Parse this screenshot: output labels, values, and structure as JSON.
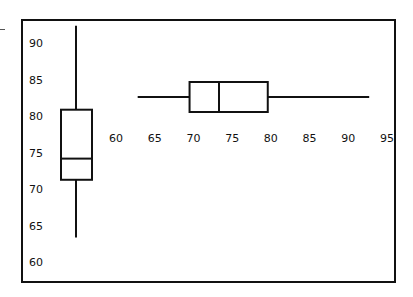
{
  "chart_data": [
    {
      "type": "boxplot",
      "orientation": "vertical",
      "title": "",
      "xlabel": "",
      "ylabel": "",
      "ticks": [
        "60",
        "65",
        "70",
        "75",
        "80",
        "85",
        "90"
      ],
      "ylim": [
        60,
        93
      ],
      "grid": false,
      "box": {
        "min": 63.5,
        "q1": 71.4,
        "median": 74.3,
        "q3": 81.0,
        "max": 92.5
      }
    },
    {
      "type": "boxplot",
      "orientation": "horizontal",
      "title": "",
      "xlabel": "",
      "ylabel": "",
      "ticks": [
        "60",
        "65",
        "70",
        "75",
        "80",
        "85",
        "90",
        "95"
      ],
      "xlim": [
        60,
        95
      ],
      "grid": false,
      "box": {
        "min": 62.8,
        "q1": 69.5,
        "median": 73.3,
        "q3": 79.6,
        "max": 92.7
      }
    }
  ],
  "colors": {
    "line": "#111111",
    "background": "#ffffff"
  }
}
